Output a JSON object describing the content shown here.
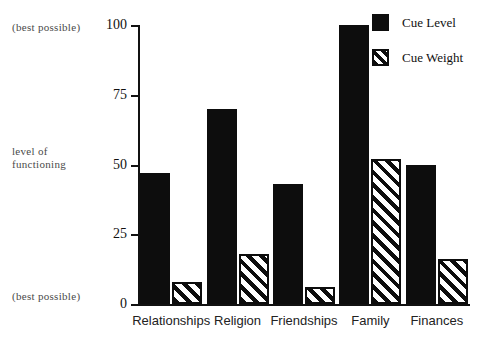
{
  "annotations": {
    "top_left": "(best possible)",
    "bottom_left": "(best possible)",
    "axis_title_line1": "level  of",
    "axis_title_line2": "functioning"
  },
  "legend": {
    "position": "top-right",
    "items": [
      {
        "label": "Cue Level",
        "swatch": "solid-black-square",
        "color": "#0d0d0d"
      },
      {
        "label": "Cue Weight",
        "swatch": "diagonal-hatch-square",
        "color": "#0d0d0d"
      }
    ]
  },
  "chart_data": {
    "type": "bar",
    "title": "",
    "xlabel": "",
    "ylabel": "level of functioning",
    "ylim": [
      0,
      100
    ],
    "yticks": [
      0,
      25,
      50,
      75,
      100
    ],
    "ytick_labels": [
      "0",
      "25",
      "50",
      "75",
      "100"
    ],
    "grid": false,
    "categories": [
      "Relationships",
      "Religion",
      "Friendships",
      "Family",
      "Finances"
    ],
    "series": [
      {
        "name": "Cue Level",
        "values": [
          47,
          70,
          43,
          100,
          50
        ]
      },
      {
        "name": "Cue Weight",
        "values": [
          8,
          18,
          6,
          52,
          16
        ]
      }
    ],
    "annotations": [
      "(best possible)",
      "(best possible)"
    ]
  }
}
